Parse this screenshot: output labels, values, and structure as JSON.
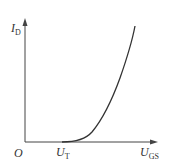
{
  "diagram": {
    "type": "transfer characteristic curve",
    "y_axis_label": "I",
    "y_axis_sub": "D",
    "x_axis_label": "U",
    "x_axis_sub": "GS",
    "origin_label": "O",
    "threshold_label": "U",
    "threshold_sub": "T",
    "line_color": "#333333"
  }
}
